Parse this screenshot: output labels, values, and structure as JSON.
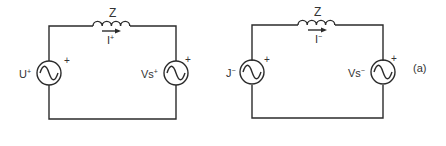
{
  "diagram": {
    "type": "circuit",
    "figure_label": "(a)",
    "circuits": [
      {
        "name": "positive-sequence",
        "impedance_label": "Z",
        "current_label": "I",
        "current_sup": "+",
        "left_source_label": "U",
        "left_source_sup": "+",
        "right_source_label": "Vs",
        "right_source_sup": "+",
        "polarity_mark": "+"
      },
      {
        "name": "negative-sequence",
        "impedance_label": "Z",
        "current_label": "I",
        "current_sup": "−",
        "left_source_label": "J",
        "left_source_sup": "−",
        "right_source_label": "Vs",
        "right_source_sup": "−",
        "polarity_mark": "+"
      }
    ],
    "colors": {
      "line": "#2b2b2b",
      "text": "#333333",
      "background": "#ffffff"
    }
  }
}
